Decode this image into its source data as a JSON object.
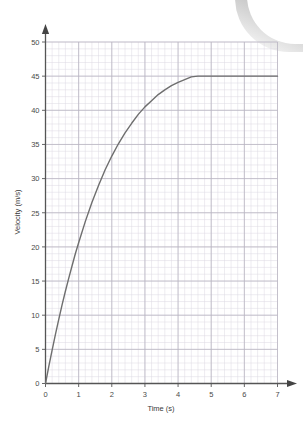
{
  "chart_data": {
    "type": "line",
    "title": "",
    "subtitle": "",
    "xlabel": "Time (s)",
    "ylabel": "Velocity (m/s)",
    "xlim": [
      0,
      7
    ],
    "ylim": [
      0,
      50
    ],
    "x_ticks": [
      0,
      1,
      2,
      3,
      4,
      5,
      6,
      7
    ],
    "y_ticks": [
      0,
      5,
      10,
      15,
      20,
      25,
      30,
      35,
      40,
      45,
      50
    ],
    "x_tick_labels": [
      "0",
      "1",
      "2",
      "3",
      "4",
      "5",
      "6",
      "7"
    ],
    "y_tick_labels": [
      "0",
      "5",
      "10",
      "15",
      "20",
      "25",
      "30",
      "35",
      "40",
      "45",
      "50"
    ],
    "x_minor_step": 0.2,
    "y_minor_step": 1,
    "grid": true,
    "grid_style": "graph-paper",
    "legend": null,
    "legend_position": "none",
    "annotations": [],
    "series": [
      {
        "name": "Velocity",
        "color": "#6e6e6e",
        "line_width": 1.4,
        "asymptote": 45,
        "x": [
          0,
          0.1,
          0.2,
          0.3,
          0.4,
          0.5,
          0.6,
          0.7,
          0.8,
          0.9,
          1.0,
          1.2,
          1.4,
          1.6,
          1.8,
          2.0,
          2.2,
          2.4,
          2.6,
          2.8,
          3.0,
          3.2,
          3.4,
          3.6,
          3.8,
          4.0,
          4.2,
          4.4,
          4.6,
          4.8,
          5.0,
          5.2,
          5.4,
          5.6,
          5.8,
          6.0,
          6.2,
          6.4,
          6.6,
          6.8,
          7.0
        ],
        "values": [
          0.0,
          2.5,
          4.9,
          7.2,
          9.4,
          11.5,
          13.5,
          15.4,
          17.2,
          19.0,
          20.6,
          23.7,
          26.5,
          29.0,
          31.3,
          33.3,
          35.1,
          36.7,
          38.1,
          39.4,
          40.5,
          41.4,
          42.3,
          43.0,
          43.6,
          44.1,
          44.5,
          44.9,
          45.0,
          45.0,
          45.0,
          45.0,
          45.0,
          45.0,
          45.0,
          45.0,
          45.0,
          45.0,
          45.0,
          45.0,
          45.0
        ]
      }
    ]
  },
  "axes": {
    "x_axis_label": "Time (s)",
    "y_axis_label": "Velocity (m/s)"
  }
}
